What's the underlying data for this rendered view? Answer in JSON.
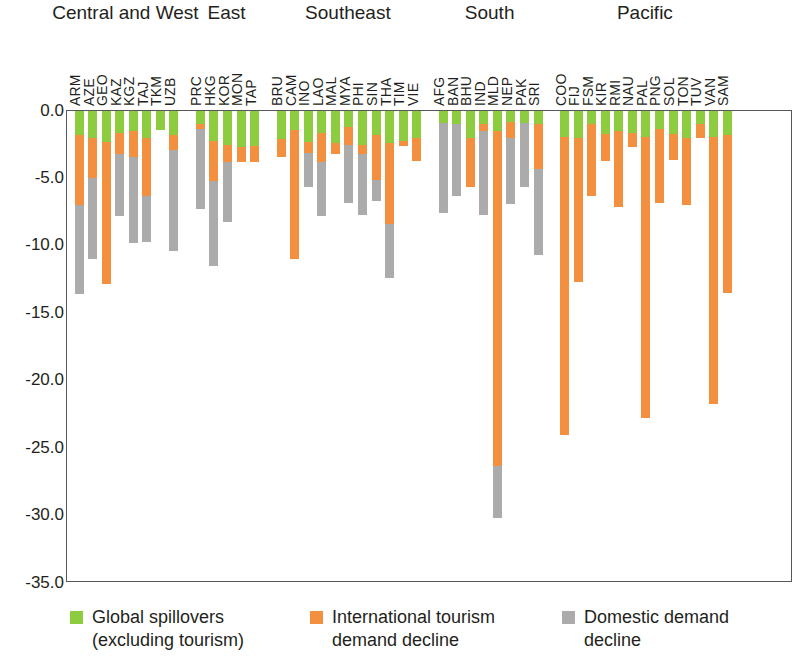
{
  "chart_data": {
    "type": "bar",
    "subtype": "stacked-negative",
    "title": "",
    "xlabel": "",
    "ylabel": "",
    "ylim": [
      -35.0,
      0.0
    ],
    "yticks": [
      "0.0",
      "-5.0",
      "-10.0",
      "-15.0",
      "-20.0",
      "-25.0",
      "-30.0",
      "-35.0"
    ],
    "ytick_values": [
      0.0,
      -5.0,
      -10.0,
      -15.0,
      -20.0,
      -25.0,
      -30.0,
      -35.0
    ],
    "grid": false,
    "legend_position": "bottom",
    "stacking_order": [
      "Global spillovers (excluding tourism)",
      "International tourism demand decline",
      "Domestic demand decline"
    ],
    "series": [
      {
        "name": "Global spillovers (excluding tourism)",
        "color": "#8ECC3F"
      },
      {
        "name": "International tourism demand decline",
        "color": "#F2903F"
      },
      {
        "name": "Domestic demand decline",
        "color": "#ABABAB"
      }
    ],
    "groups": [
      {
        "name": "Central and West",
        "categories": [
          "ARM",
          "AZE",
          "GEO",
          "KAZ",
          "KGZ",
          "TAJ",
          "TKM",
          "UZB"
        ],
        "global_spillovers": [
          -1.8,
          -2.0,
          -2.3,
          -1.6,
          -1.5,
          -2.0,
          -1.4,
          -1.8
        ],
        "tourism_decline": [
          -5.2,
          -3.0,
          -10.5,
          -1.6,
          -1.9,
          -4.3,
          0.0,
          -1.1
        ],
        "domestic_decline": [
          -6.6,
          -6.0,
          0.0,
          -4.6,
          -6.4,
          -3.4,
          0.0,
          -7.5
        ],
        "totals": [
          -13.6,
          -11.0,
          -12.8,
          -7.8,
          -9.8,
          -9.7,
          -1.4,
          -10.4
        ]
      },
      {
        "name": "East",
        "categories": [
          "PRC",
          "HKG",
          "KOR",
          "MON",
          "TAP"
        ],
        "global_spillovers": [
          -1.0,
          -2.2,
          -2.5,
          -2.7,
          -2.6
        ],
        "tourism_decline": [
          -0.3,
          -3.0,
          -1.3,
          -1.1,
          -1.2
        ],
        "domestic_decline": [
          -6.0,
          -6.3,
          -4.4,
          0.0,
          0.0
        ],
        "totals": [
          -7.3,
          -11.5,
          -8.2,
          -3.8,
          -3.8
        ]
      },
      {
        "name": "Southeast",
        "categories": [
          "BRU",
          "CAM",
          "INO",
          "LAO",
          "MAL",
          "MYA",
          "PHI",
          "SIN",
          "THA",
          "TIM",
          "VIE"
        ],
        "global_spillovers": [
          -2.1,
          -1.4,
          -2.3,
          -1.6,
          -2.4,
          -1.2,
          -2.5,
          -1.8,
          -2.4,
          -2.2,
          -2.0
        ],
        "tourism_decline": [
          -1.3,
          -9.6,
          -0.8,
          -2.2,
          -0.8,
          -1.3,
          -0.7,
          -3.3,
          -6.0,
          -0.4,
          -1.7
        ],
        "domestic_decline": [
          0.0,
          0.0,
          -2.5,
          -4.0,
          0.0,
          -4.3,
          -4.5,
          -1.6,
          -4.0,
          0.0,
          0.0
        ],
        "totals": [
          -3.4,
          -11.0,
          -5.6,
          -7.8,
          -3.2,
          -6.8,
          -7.7,
          -6.7,
          -12.4,
          -2.6,
          -3.7
        ]
      },
      {
        "name": "South",
        "categories": [
          "AFG",
          "BAN",
          "BHU",
          "IND",
          "MLD",
          "NEP",
          "PAK",
          "SRI"
        ],
        "global_spillovers": [
          -0.9,
          -1.0,
          -2.0,
          -1.0,
          -1.5,
          -0.8,
          -0.9,
          -1.0
        ],
        "tourism_decline": [
          0.0,
          0.0,
          -3.6,
          -0.5,
          -24.8,
          -1.2,
          0.0,
          -3.3
        ],
        "domestic_decline": [
          -6.7,
          -5.3,
          0.0,
          -6.2,
          -3.9,
          -4.9,
          -4.7,
          -6.4
        ],
        "totals": [
          -7.6,
          -6.3,
          -5.6,
          -7.7,
          -30.2,
          -6.9,
          -5.6,
          -10.7
        ]
      },
      {
        "name": "Pacific",
        "categories": [
          "COO",
          "FIJ",
          "FSM",
          "KIR",
          "RMI",
          "NAU",
          "PAL",
          "PNG",
          "SOL",
          "TON",
          "TUV",
          "VAN",
          "SAM"
        ],
        "global_spillovers": [
          -1.9,
          -2.0,
          -1.0,
          -1.7,
          -1.5,
          -1.6,
          -1.9,
          -1.3,
          -1.7,
          -2.0,
          -1.0,
          -1.9,
          -1.8
        ],
        "tourism_decline": [
          -22.1,
          -10.7,
          -5.3,
          -2.0,
          -5.6,
          -1.1,
          -20.9,
          -5.5,
          -1.9,
          -5.0,
          -1.0,
          -19.8,
          -11.7
        ],
        "domestic_decline": [
          0.0,
          0.0,
          0.0,
          0.0,
          0.0,
          0.0,
          0.0,
          0.0,
          0.0,
          0.0,
          0.0,
          0.0,
          0.0
        ],
        "totals": [
          -24.0,
          -12.7,
          -6.3,
          -3.7,
          -7.1,
          -2.7,
          -22.8,
          -6.8,
          -3.6,
          -7.0,
          -2.0,
          -21.7,
          -13.5
        ]
      }
    ]
  },
  "legend": {
    "items": [
      {
        "label": "Global spillovers\n(excluding tourism)",
        "color": "#8ECC3F",
        "icon": "green-square-swatch"
      },
      {
        "label": "International tourism\ndemand decline",
        "color": "#F2903F",
        "icon": "orange-square-swatch"
      },
      {
        "label": "Domestic demand\ndecline",
        "color": "#ABABAB",
        "icon": "gray-square-swatch"
      }
    ]
  }
}
